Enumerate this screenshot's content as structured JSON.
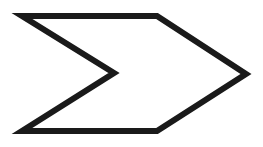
{
  "diagram": {
    "shape": "chevron-arrow",
    "fill": "#ffffff",
    "stroke": "#1a1a1a",
    "stroke_width": 6,
    "points": "22,16 157,16 246,74 157,131 22,131 114,73"
  }
}
